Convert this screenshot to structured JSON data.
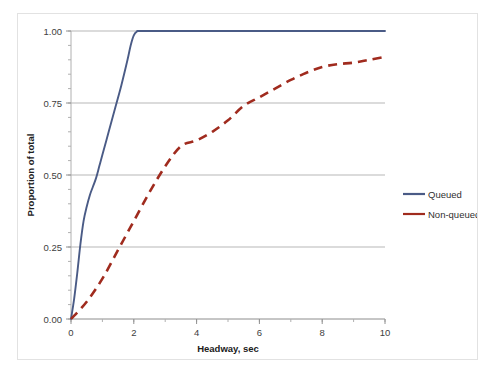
{
  "chart_data": {
    "type": "line",
    "title": "",
    "xlabel": "Headway, sec",
    "ylabel": "Proportion of total",
    "xlim": [
      0,
      10
    ],
    "ylim": [
      0,
      1.0
    ],
    "xticks": [
      0,
      2,
      4,
      6,
      8,
      10
    ],
    "xtick_labels": [
      "0",
      "2",
      "4",
      "6",
      "8",
      "10"
    ],
    "x_minor_tick_interval": 1,
    "yticks": [
      0.0,
      0.25,
      0.5,
      0.75,
      1.0
    ],
    "ytick_labels": [
      "0.00",
      "0.25",
      "0.50",
      "0.75",
      "1.00"
    ],
    "y_minor_tick_interval": 0.05,
    "grid": "horizontal-major",
    "legend_position": "right",
    "series": [
      {
        "name": "Queued",
        "color": "#4a5b86",
        "style": "solid",
        "x": [
          0.0,
          0.1,
          0.2,
          0.3,
          0.4,
          0.5,
          0.6,
          0.7,
          0.8,
          0.9,
          1.0,
          1.2,
          1.4,
          1.6,
          1.8,
          1.9,
          2.0,
          2.1,
          2.2,
          3.0,
          4.0,
          5.0,
          6.0,
          7.0,
          8.0,
          9.0,
          10.0
        ],
        "y": [
          0.0,
          0.07,
          0.16,
          0.26,
          0.34,
          0.39,
          0.43,
          0.46,
          0.49,
          0.53,
          0.57,
          0.65,
          0.73,
          0.81,
          0.9,
          0.95,
          0.985,
          0.998,
          1.0,
          1.0,
          1.0,
          1.0,
          1.0,
          1.0,
          1.0,
          1.0,
          1.0
        ]
      },
      {
        "name": "Non-queued",
        "color": "#a02b1e",
        "style": "dashed",
        "x": [
          0.0,
          0.5,
          1.0,
          1.5,
          2.0,
          2.5,
          3.0,
          3.5,
          4.0,
          4.5,
          5.0,
          5.5,
          6.0,
          6.5,
          7.0,
          7.5,
          8.0,
          8.5,
          9.0,
          9.5,
          10.0
        ],
        "y": [
          0.0,
          0.06,
          0.14,
          0.24,
          0.34,
          0.44,
          0.53,
          0.6,
          0.62,
          0.65,
          0.69,
          0.74,
          0.77,
          0.8,
          0.83,
          0.855,
          0.875,
          0.885,
          0.89,
          0.9,
          0.91
        ]
      }
    ],
    "legend_entries": [
      {
        "label": "Queued",
        "color": "#4a5b86",
        "style": "solid"
      },
      {
        "label": "Non-queued",
        "color": "#a02b1e",
        "style": "solid"
      }
    ]
  }
}
